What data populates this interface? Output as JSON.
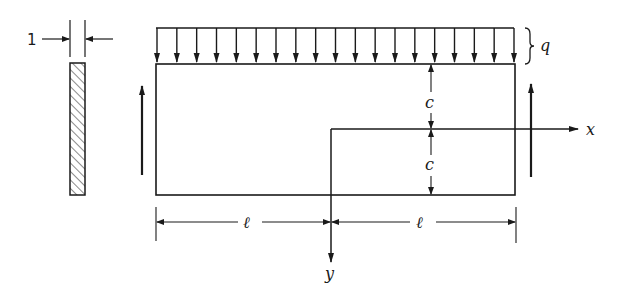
{
  "diagram": {
    "type": "beam-with-uniform-load",
    "section": {
      "thickness_label": "1"
    },
    "load": {
      "label": "q",
      "arrow_count": 19
    },
    "dimensions": {
      "half_depth_upper": "c",
      "half_depth_lower": "c",
      "half_span_left": "ℓ",
      "half_span_right": "ℓ"
    },
    "axes": {
      "x_label": "x",
      "y_label": "y"
    },
    "colors": {
      "line": "#1a1a1a",
      "background": "#ffffff"
    }
  }
}
